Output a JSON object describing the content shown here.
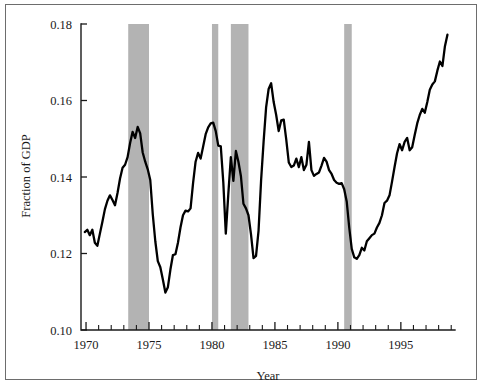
{
  "chart_data": {
    "type": "line",
    "title": "",
    "xlabel": "Year",
    "ylabel": "Fraction of GDP",
    "xlim": [
      1969.6,
      1999.3
    ],
    "ylim": [
      0.1,
      0.18
    ],
    "grid": false,
    "legend": null,
    "x_ticks": [
      1970,
      1975,
      1980,
      1985,
      1990,
      1995
    ],
    "x_tick_labels": [
      "1970",
      "1975",
      "1980",
      "1985",
      "1990",
      "1995"
    ],
    "x_minor_tick_step": 1,
    "y_ticks": [
      0.1,
      0.12,
      0.14,
      0.16,
      0.18
    ],
    "y_tick_labels": [
      "0.10",
      "0.12",
      "0.14",
      "0.16",
      "0.18"
    ],
    "line_color": "#000000",
    "shaded_region_color": "#b3b3b3",
    "shaded_regions": [
      {
        "label": "recession-1973-1975",
        "start": 1973.35,
        "end": 1975.0
      },
      {
        "label": "recession-1980",
        "start": 1980.0,
        "end": 1980.5
      },
      {
        "label": "recession-1981-1982",
        "start": 1981.5,
        "end": 1982.9
      },
      {
        "label": "recession-1990-1991",
        "start": 1990.5,
        "end": 1991.1
      }
    ],
    "series": [
      {
        "name": "Fraction of GDP",
        "x": [
          1969.9,
          1970.1,
          1970.3,
          1970.5,
          1970.7,
          1970.9,
          1971.1,
          1971.3,
          1971.5,
          1971.7,
          1971.9,
          1972.1,
          1972.3,
          1972.5,
          1972.7,
          1972.9,
          1973.1,
          1973.3,
          1973.5,
          1973.7,
          1973.9,
          1974.1,
          1974.3,
          1974.5,
          1974.7,
          1974.9,
          1975.1,
          1975.3,
          1975.5,
          1975.7,
          1975.9,
          1976.1,
          1976.3,
          1976.5,
          1976.7,
          1976.9,
          1977.1,
          1977.3,
          1977.5,
          1977.7,
          1977.9,
          1978.1,
          1978.3,
          1978.5,
          1978.7,
          1978.9,
          1979.1,
          1979.3,
          1979.5,
          1979.7,
          1979.9,
          1980.1,
          1980.3,
          1980.5,
          1980.7,
          1980.9,
          1981.1,
          1981.3,
          1981.5,
          1981.7,
          1981.9,
          1982.1,
          1982.3,
          1982.5,
          1982.7,
          1982.9,
          1983.1,
          1983.3,
          1983.5,
          1983.7,
          1983.9,
          1984.1,
          1984.3,
          1984.5,
          1984.7,
          1984.9,
          1985.1,
          1985.3,
          1985.5,
          1985.7,
          1985.9,
          1986.1,
          1986.3,
          1986.5,
          1986.7,
          1986.9,
          1987.1,
          1987.3,
          1987.5,
          1987.7,
          1987.9,
          1988.1,
          1988.3,
          1988.5,
          1988.7,
          1988.9,
          1989.1,
          1989.3,
          1989.5,
          1989.7,
          1989.9,
          1990.1,
          1990.3,
          1990.5,
          1990.7,
          1990.9,
          1991.1,
          1991.3,
          1991.5,
          1991.7,
          1991.9,
          1992.1,
          1992.3,
          1992.5,
          1992.7,
          1992.9,
          1993.1,
          1993.3,
          1993.5,
          1993.7,
          1993.9,
          1994.1,
          1994.3,
          1994.5,
          1994.7,
          1994.9,
          1995.1,
          1995.3,
          1995.5,
          1995.7,
          1995.9,
          1996.1,
          1996.3,
          1996.5,
          1996.7,
          1996.9,
          1997.1,
          1997.3,
          1997.5,
          1997.7,
          1997.9,
          1998.1,
          1998.3,
          1998.5,
          1998.7
        ],
        "y": [
          0.1256,
          0.1262,
          0.1248,
          0.1262,
          0.1228,
          0.122,
          0.1252,
          0.1283,
          0.1316,
          0.1338,
          0.1352,
          0.134,
          0.1326,
          0.1358,
          0.1396,
          0.1424,
          0.1432,
          0.1452,
          0.1489,
          0.1518,
          0.1502,
          0.1531,
          0.1514,
          0.1464,
          0.144,
          0.142,
          0.1392,
          0.1302,
          0.1232,
          0.118,
          0.1164,
          0.1132,
          0.1098,
          0.1112,
          0.1158,
          0.1196,
          0.1198,
          0.1228,
          0.1268,
          0.13,
          0.1312,
          0.131,
          0.1318,
          0.1384,
          0.144,
          0.1463,
          0.1448,
          0.148,
          0.1512,
          0.153,
          0.154,
          0.1542,
          0.152,
          0.1482,
          0.148,
          0.1386,
          0.1252,
          0.1356,
          0.1452,
          0.139,
          0.1468,
          0.144,
          0.1402,
          0.133,
          0.1318,
          0.13,
          0.125,
          0.1188,
          0.1194,
          0.126,
          0.139,
          0.1492,
          0.1582,
          0.163,
          0.1645,
          0.1596,
          0.1562,
          0.152,
          0.1548,
          0.155,
          0.1498,
          0.1438,
          0.1426,
          0.143,
          0.1448,
          0.1426,
          0.1452,
          0.1418,
          0.1432,
          0.1492,
          0.1418,
          0.1403,
          0.1408,
          0.1412,
          0.143,
          0.145,
          0.144,
          0.1418,
          0.1408,
          0.1392,
          0.1385,
          0.1382,
          0.1384,
          0.1368,
          0.1336,
          0.1268,
          0.1212,
          0.119,
          0.1186,
          0.1196,
          0.1215,
          0.1208,
          0.1232,
          0.124,
          0.1248,
          0.1252,
          0.1268,
          0.128,
          0.13,
          0.1332,
          0.1338,
          0.1352,
          0.1388,
          0.1426,
          0.1462,
          0.1486,
          0.147,
          0.1492,
          0.1502,
          0.147,
          0.1478,
          0.151,
          0.154,
          0.1562,
          0.1578,
          0.1568,
          0.1596,
          0.1628,
          0.1642,
          0.165,
          0.1678,
          0.1702,
          0.169,
          0.1742,
          0.1772
        ]
      }
    ]
  },
  "axis": {
    "x_title": "Year",
    "y_title": "Fraction of GDP"
  }
}
